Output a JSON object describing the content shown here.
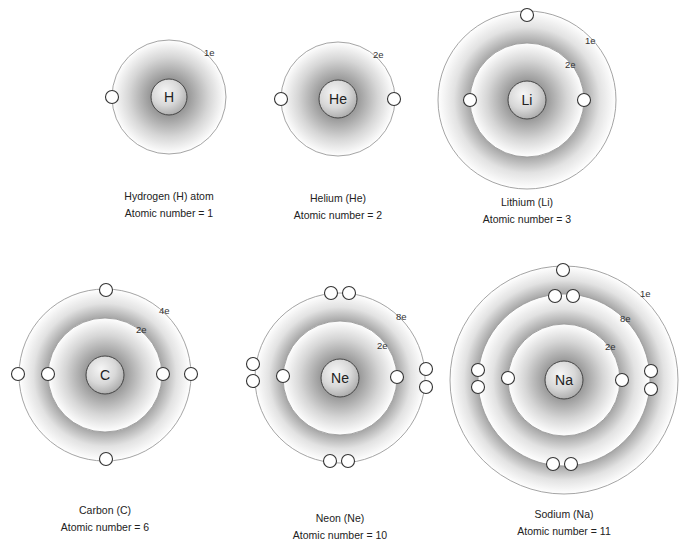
{
  "colors": {
    "ring_stroke": "#9a9a9a",
    "electron_stroke": "#333333",
    "electron_fill": "#ffffff",
    "nucleus_stroke": "#444444",
    "shell_dark": "#8c8c8c",
    "text": "#222222"
  },
  "atoms": [
    {
      "id": "hydrogen",
      "symbol": "H",
      "name_label": "Hydrogen (H) atom",
      "atomic_number_label": "Atomic number = 1",
      "center": [
        169,
        97
      ],
      "nucleus_r": 18,
      "shells": [
        {
          "r": 57,
          "label": "1e",
          "label_pos": [
            204,
            56
          ],
          "electrons": [
            [
              112,
              97
            ]
          ]
        }
      ],
      "caption_pos": [
        69,
        188
      ]
    },
    {
      "id": "helium",
      "symbol": "He",
      "name_label": "Helium (He)",
      "atomic_number_label": "Atomic number = 2",
      "center": [
        338,
        99
      ],
      "nucleus_r": 19,
      "shells": [
        {
          "r": 57,
          "label": "2e",
          "label_pos": [
            373,
            58
          ],
          "electrons": [
            [
              281,
              99
            ],
            [
              394,
              99
            ]
          ]
        }
      ],
      "caption_pos": [
        238,
        190
      ]
    },
    {
      "id": "lithium",
      "symbol": "Li",
      "name_label": "Lithium (Li)",
      "atomic_number_label": "Atomic number = 3",
      "center": [
        527,
        100
      ],
      "nucleus_r": 19,
      "shells": [
        {
          "r": 57,
          "label": "2e",
          "label_pos": [
            565,
            68
          ],
          "electrons": [
            [
              470,
              100
            ],
            [
              584,
              100
            ]
          ]
        },
        {
          "r": 89,
          "label": "1e",
          "label_pos": [
            585,
            44
          ],
          "electrons": [
            [
              527,
              15
            ]
          ]
        }
      ],
      "caption_pos": [
        427,
        194
      ]
    },
    {
      "id": "carbon",
      "symbol": "C",
      "name_label": "Carbon (C)",
      "atomic_number_label": "Atomic number = 6",
      "center": [
        105,
        375
      ],
      "nucleus_r": 19,
      "shells": [
        {
          "r": 57,
          "label": "2e",
          "label_pos": [
            136,
            333
          ],
          "electrons": [
            [
              48,
              374
            ],
            [
              163,
              374
            ]
          ]
        },
        {
          "r": 86,
          "label": "4e",
          "label_pos": [
            159,
            314
          ],
          "electrons": [
            [
              106,
              290
            ],
            [
              18,
              374
            ],
            [
              191,
              374
            ],
            [
              106,
              459
            ]
          ]
        }
      ],
      "caption_pos": [
        5,
        502
      ]
    },
    {
      "id": "neon",
      "symbol": "Ne",
      "name_label": "Neon (Ne)",
      "atomic_number_label": "Atomic number = 10",
      "center": [
        340,
        378
      ],
      "nucleus_r": 19,
      "shells": [
        {
          "r": 57,
          "label": "2e",
          "label_pos": [
            377,
            349
          ],
          "electrons": [
            [
              283,
              376
            ],
            [
              397,
              377
            ]
          ]
        },
        {
          "r": 85,
          "label": "8e",
          "label_pos": [
            396,
            320
          ],
          "electrons": [
            [
              331,
              293
            ],
            [
              349,
              293
            ],
            [
              253,
              364
            ],
            [
              253,
              381
            ],
            [
              426,
              369
            ],
            [
              426,
              387
            ],
            [
              330,
              461
            ],
            [
              348,
              461
            ]
          ]
        }
      ],
      "caption_pos": [
        240,
        510
      ]
    },
    {
      "id": "sodium",
      "symbol": "Na",
      "name_label": "Sodium (Na)",
      "atomic_number_label": "Atomic number = 11",
      "center": [
        564,
        380
      ],
      "nucleus_r": 19,
      "shells": [
        {
          "r": 56,
          "label": "2e",
          "label_pos": [
            605,
            350
          ],
          "electrons": [
            [
              508,
              378
            ],
            [
              622,
              380
            ]
          ]
        },
        {
          "r": 86,
          "label": "8e",
          "label_pos": [
            620,
            322
          ],
          "electrons": [
            [
              555,
              296
            ],
            [
              573,
              296
            ],
            [
              478,
              370
            ],
            [
              478,
              387
            ],
            [
              651,
              371
            ],
            [
              651,
              389
            ],
            [
              553,
              464
            ],
            [
              571,
              464
            ]
          ]
        },
        {
          "r": 114,
          "label": "1e",
          "label_pos": [
            640,
            297
          ],
          "electrons": [
            [
              563,
              270
            ]
          ]
        }
      ],
      "caption_pos": [
        464,
        506
      ]
    }
  ]
}
